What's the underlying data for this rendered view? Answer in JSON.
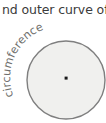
{
  "figure": {
    "caption_fragment": "nd outer curve of",
    "circle_label": "circumference",
    "center_dot_name": "center-point",
    "colors": {
      "caption_text": "#3b3b3b",
      "label_text": "#6f6f6d",
      "circle_fill": "#f0f0ee",
      "circle_stroke": "#7f7f7f",
      "center_dot": "#1a1a1a",
      "background": "#ffffff"
    },
    "geometry": {
      "circle_center_x": 66,
      "circle_center_y": 80,
      "circle_radius": 39,
      "center_dot_x": 66,
      "center_dot_y": 78,
      "center_dot_size": 3
    }
  }
}
